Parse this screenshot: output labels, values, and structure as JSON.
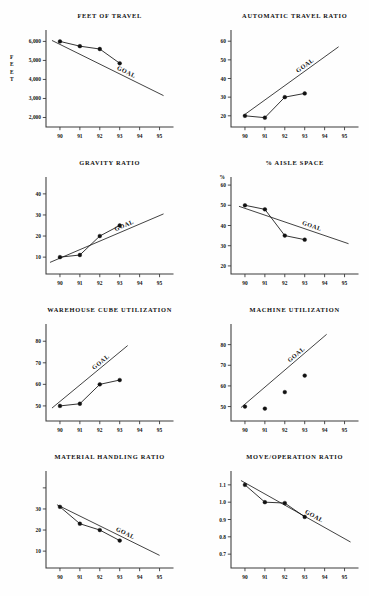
{
  "page": {
    "header_fragment": "",
    "background": "#fefefe",
    "ink_color": "#111111"
  },
  "axis": {
    "x_categories": [
      "90",
      "91",
      "92",
      "93",
      "94",
      "95"
    ],
    "x_label": ""
  },
  "goal_label": "GOAL",
  "charts": [
    {
      "id": "feet-of-travel",
      "title": "FEET OF TRAVEL",
      "y_axis_name": "FEET",
      "y_axis_name_orientation": "stacked",
      "y_ticks": [
        "6,000",
        "5,000",
        "4,000",
        "3,000",
        "2,000"
      ]
    },
    {
      "id": "automatic-travel-ratio",
      "title": "AUTOMATIC TRAVEL RATIO",
      "y_axis_name": "",
      "y_ticks": [
        "60",
        "50",
        "40",
        "30",
        "20"
      ]
    },
    {
      "id": "gravity-ratio",
      "title": "GRAVITY RATIO",
      "y_axis_name": "",
      "y_ticks": [
        "40",
        "30",
        "20",
        "10"
      ]
    },
    {
      "id": "percent-aisle-space",
      "title": "% AISLE SPACE",
      "y_axis_name": "%",
      "y_ticks": [
        "60",
        "50",
        "40",
        "30",
        "20"
      ]
    },
    {
      "id": "warehouse-cube-utilization",
      "title": "WAREHOUSE CUBE UTILIZATION",
      "y_axis_name": "",
      "y_ticks": [
        "80",
        "70",
        "60",
        "50"
      ]
    },
    {
      "id": "machine-utilization",
      "title": "MACHINE UTILIZATION",
      "y_axis_name": "",
      "y_ticks": [
        "80",
        "70",
        "60",
        "50"
      ]
    },
    {
      "id": "material-handling-ratio",
      "title": "MATERIAL HANDLING RATIO",
      "y_axis_name": "",
      "y_ticks": [
        "30",
        "20",
        "10"
      ]
    },
    {
      "id": "move-operation-ratio",
      "title": "MOVE/OPERATION RATIO",
      "y_axis_name": "",
      "y_ticks": [
        "1.1",
        "1.0",
        "0.9",
        "0.8",
        "0.7"
      ]
    }
  ],
  "chart_data": [
    {
      "type": "line",
      "title": "FEET OF TRAVEL",
      "xlabel": "",
      "ylabel": "FEET",
      "categories": [
        "90",
        "91",
        "92",
        "93",
        "94",
        "95"
      ],
      "x": [
        90,
        91,
        92,
        93
      ],
      "ylim": [
        1500,
        6600
      ],
      "yticks": [
        2000,
        3000,
        4000,
        5000,
        6000
      ],
      "ytick_labels": [
        "2,000",
        "3,000",
        "4,000",
        "5,000",
        "6,000"
      ],
      "grid": false,
      "legend": "none",
      "series": [
        {
          "name": "actual",
          "values": [
            6000,
            5750,
            5600,
            4850
          ],
          "markers": true,
          "connected": true
        },
        {
          "name": "GOAL",
          "type": "trend",
          "x": [
            89.6,
            95.2
          ],
          "values": [
            6050,
            3150
          ],
          "markers": false,
          "annotation": "GOAL"
        }
      ]
    },
    {
      "type": "line",
      "title": "AUTOMATIC TRAVEL RATIO",
      "xlabel": "",
      "ylabel": "",
      "categories": [
        "90",
        "91",
        "92",
        "93",
        "94",
        "95"
      ],
      "x": [
        90,
        91,
        92,
        93
      ],
      "ylim": [
        14,
        66
      ],
      "yticks": [
        20,
        30,
        40,
        50,
        60
      ],
      "ytick_labels": [
        "20",
        "30",
        "40",
        "50",
        "60"
      ],
      "grid": false,
      "legend": "none",
      "series": [
        {
          "name": "actual",
          "values": [
            20,
            19,
            30,
            32
          ],
          "markers": true,
          "connected": true
        },
        {
          "name": "GOAL",
          "type": "trend",
          "x": [
            89.9,
            94.7
          ],
          "values": [
            20,
            57
          ],
          "markers": false,
          "annotation": "GOAL"
        }
      ]
    },
    {
      "type": "line",
      "title": "GRAVITY RATIO",
      "xlabel": "",
      "ylabel": "",
      "categories": [
        "90",
        "91",
        "92",
        "93",
        "94",
        "95"
      ],
      "x": [
        90,
        91,
        92,
        93
      ],
      "ylim": [
        2,
        48
      ],
      "yticks": [
        10,
        20,
        30,
        40
      ],
      "ytick_labels": [
        "10",
        "20",
        "30",
        "40"
      ],
      "grid": false,
      "legend": "none",
      "series": [
        {
          "name": "actual",
          "values": [
            10,
            11,
            20,
            25
          ],
          "markers": true,
          "connected": true
        },
        {
          "name": "GOAL",
          "type": "trend",
          "x": [
            89.5,
            95.2
          ],
          "values": [
            7.5,
            30.5
          ],
          "markers": false,
          "annotation": "GOAL"
        }
      ]
    },
    {
      "type": "line",
      "title": "% AISLE SPACE",
      "xlabel": "",
      "ylabel": "%",
      "categories": [
        "90",
        "91",
        "92",
        "93",
        "94",
        "95"
      ],
      "x": [
        90,
        91,
        92,
        93
      ],
      "ylim": [
        16,
        64
      ],
      "yticks": [
        20,
        30,
        40,
        50,
        60
      ],
      "ytick_labels": [
        "20",
        "30",
        "40",
        "50",
        "60"
      ],
      "grid": false,
      "legend": "none",
      "series": [
        {
          "name": "actual",
          "values": [
            50,
            48,
            35,
            33
          ],
          "markers": true,
          "connected": true
        },
        {
          "name": "GOAL",
          "type": "trend",
          "x": [
            89.7,
            95.2
          ],
          "values": [
            49.5,
            31
          ],
          "markers": false,
          "annotation": "GOAL"
        }
      ]
    },
    {
      "type": "line",
      "title": "WAREHOUSE CUBE UTILIZATION",
      "xlabel": "",
      "ylabel": "",
      "categories": [
        "90",
        "91",
        "92",
        "93",
        "94",
        "95"
      ],
      "x": [
        90,
        91,
        92,
        93
      ],
      "ylim": [
        43,
        88
      ],
      "yticks": [
        50,
        60,
        70,
        80
      ],
      "ytick_labels": [
        "50",
        "60",
        "70",
        "80"
      ],
      "grid": false,
      "legend": "none",
      "series": [
        {
          "name": "actual",
          "values": [
            50,
            51,
            60,
            62
          ],
          "markers": true,
          "connected": true
        },
        {
          "name": "GOAL",
          "type": "trend",
          "x": [
            89.6,
            93.4
          ],
          "values": [
            49,
            78
          ],
          "markers": false,
          "annotation": "GOAL"
        }
      ]
    },
    {
      "type": "scatter",
      "title": "MACHINE UTILIZATION",
      "xlabel": "",
      "ylabel": "",
      "categories": [
        "90",
        "91",
        "92",
        "93",
        "94",
        "95"
      ],
      "x": [
        90,
        91,
        92,
        93
      ],
      "ylim": [
        43,
        90
      ],
      "yticks": [
        50,
        60,
        70,
        80
      ],
      "ytick_labels": [
        "50",
        "60",
        "70",
        "80"
      ],
      "grid": false,
      "legend": "none",
      "series": [
        {
          "name": "actual",
          "values": [
            50,
            49,
            57,
            65
          ],
          "markers": true,
          "connected": false
        },
        {
          "name": "GOAL",
          "type": "trend",
          "x": [
            89.8,
            94.1
          ],
          "values": [
            49.5,
            85
          ],
          "markers": false,
          "annotation": "GOAL"
        }
      ]
    },
    {
      "type": "line",
      "title": "MATERIAL HANDLING RATIO",
      "xlabel": "",
      "ylabel": "",
      "categories": [
        "90",
        "91",
        "92",
        "93",
        "94",
        "95"
      ],
      "x": [
        90,
        91,
        92,
        93
      ],
      "ylim": [
        2,
        48
      ],
      "yticks": [
        10,
        20,
        30
      ],
      "ytick_labels": [
        "10",
        "20",
        "30"
      ],
      "grid": false,
      "legend": "none",
      "series": [
        {
          "name": "actual",
          "values": [
            31,
            23,
            20,
            15
          ],
          "markers": true,
          "connected": true
        },
        {
          "name": "GOAL",
          "type": "trend",
          "x": [
            89.85,
            95.0
          ],
          "values": [
            32,
            8
          ],
          "markers": false,
          "annotation": "GOAL"
        }
      ]
    },
    {
      "type": "line",
      "title": "MOVE/OPERATION RATIO",
      "xlabel": "",
      "ylabel": "",
      "categories": [
        "90",
        "91",
        "92",
        "93",
        "94",
        "95"
      ],
      "x": [
        90,
        91,
        92,
        93
      ],
      "ylim": [
        0.62,
        1.18
      ],
      "yticks": [
        0.7,
        0.8,
        0.9,
        1.0,
        1.1
      ],
      "ytick_labels": [
        "0.7",
        "0.8",
        "0.9",
        "1.0",
        "1.1"
      ],
      "grid": false,
      "legend": "none",
      "series": [
        {
          "name": "actual",
          "values": [
            1.1,
            1.0,
            0.995,
            0.915
          ],
          "markers": true,
          "connected": true
        },
        {
          "name": "GOAL",
          "type": "trend",
          "x": [
            89.8,
            95.3
          ],
          "values": [
            1.125,
            0.77
          ],
          "markers": false,
          "annotation": "GOAL"
        }
      ]
    }
  ]
}
